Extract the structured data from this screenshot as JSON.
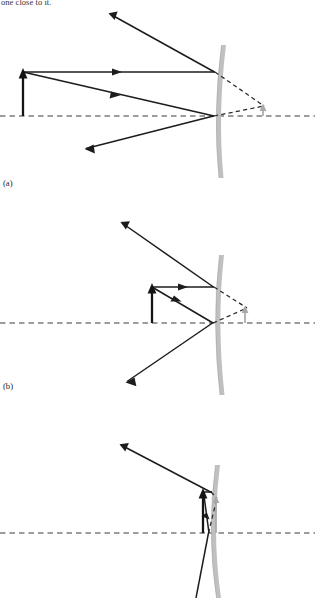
{
  "document": {
    "body_text_fragment": "one close to it.",
    "figure_type": "ray-diagram",
    "description": "Three ray-tracing diagrams for a convex mirror showing an object at decreasing distances from the mirror surface and the resulting virtual, upright, diminished images."
  },
  "panels": [
    {
      "id": "a",
      "label": "(a)",
      "label_x": 3,
      "label_y": 178,
      "object": {
        "name": "object-arrow",
        "base_x": 23,
        "base_y": 116,
        "tip_y": 72,
        "color": "#141414",
        "orientation": "upright"
      },
      "image": {
        "name": "image-arrow",
        "base_x": 263,
        "base_y": 116,
        "tip_y": 105,
        "color": "#a8a8a8",
        "orientation": "upright",
        "nature": "virtual"
      },
      "mirror": {
        "name": "convex-mirror",
        "vertex_x": 216,
        "vertex_y": 116,
        "top_x": 223,
        "top_y": 45,
        "bottom_x": 221,
        "bottom_y": 178,
        "thickness": 4.5,
        "color": "#bdbdbd"
      },
      "axis": {
        "y": 116,
        "x1": 0,
        "x2": 315
      },
      "rays": [
        {
          "name": "parallel-incident-ray",
          "points": "23,72 215,72",
          "head_at": "105,72",
          "head_angle": 0
        },
        {
          "name": "parallel-reflected-ray",
          "points": "215,72 109,14",
          "head_at": "111,15",
          "head_angle": 209
        },
        {
          "name": "vertex-incident-ray",
          "points": "23,72 214,116",
          "head_at": "110,96",
          "head_angle": 13
        },
        {
          "name": "vertex-reflected-ray",
          "points": "214,116 86,148",
          "head_at": "89,147",
          "head_angle": 194
        }
      ],
      "virtual_rays": [
        {
          "name": "virtual-ray-from-parallel",
          "points": "215,72 264,106"
        },
        {
          "name": "virtual-ray-from-vertex",
          "points": "214,116 264,106"
        }
      ]
    },
    {
      "id": "b",
      "label": "(b)",
      "label_x": 3,
      "label_y": 381,
      "object": {
        "name": "object-arrow",
        "base_x": 152,
        "base_y": 323,
        "tip_y": 287,
        "color": "#141414",
        "orientation": "upright"
      },
      "image": {
        "name": "image-arrow",
        "base_x": 245,
        "base_y": 323,
        "tip_y": 307,
        "color": "#a8a8a8",
        "orientation": "upright",
        "nature": "virtual"
      },
      "mirror": {
        "name": "convex-mirror",
        "vertex_x": 215,
        "vertex_y": 323,
        "top_x": 221,
        "top_y": 255,
        "bottom_x": 222,
        "bottom_y": 395,
        "thickness": 4.5,
        "color": "#bdbdbd"
      },
      "axis": {
        "y": 323,
        "x1": 0,
        "x2": 315
      },
      "rays": [
        {
          "name": "parallel-incident-ray",
          "points": "152,287 214,287",
          "head_at": "178,287",
          "head_angle": 0
        },
        {
          "name": "parallel-reflected-ray",
          "points": "214,287 122,223",
          "head_at": "124,225",
          "head_angle": 215
        },
        {
          "name": "vertex-incident-ray",
          "points": "152,287 213,323",
          "head_at": "172,300",
          "head_angle": 31
        },
        {
          "name": "vertex-reflected-ray",
          "points": "213,323 127,381",
          "head_at": "130,379",
          "head_angle": 214
        }
      ],
      "virtual_rays": [
        {
          "name": "virtual-ray-from-parallel",
          "points": "214,287 246,308"
        },
        {
          "name": "virtual-ray-from-vertex",
          "points": "213,323 246,308"
        }
      ]
    },
    {
      "id": "c",
      "label": "",
      "object": {
        "name": "object-arrow",
        "base_x": 205,
        "base_y": 533,
        "tip_y": 492,
        "color": "#141414",
        "orientation": "upright"
      },
      "image": {
        "name": "image-arrow",
        "base_x": 216,
        "base_y": 533,
        "tip_y": 496,
        "color": "#a8a8a8",
        "orientation": "upright",
        "nature": "virtual"
      },
      "mirror": {
        "name": "convex-mirror",
        "vertex_x": 211,
        "vertex_y": 533,
        "top_x": 217,
        "top_y": 465,
        "bottom_x": 218,
        "bottom_y": 598,
        "thickness": 4.5,
        "color": "#bdbdbd"
      },
      "axis": {
        "y": 533,
        "x1": 0,
        "x2": 315
      },
      "rays": [
        {
          "name": "parallel-incident-ray",
          "points": "205,492 212,492",
          "head_at": "209,492",
          "head_angle": 0
        },
        {
          "name": "parallel-reflected-ray",
          "points": "212,492 121,445",
          "head_at": "123,446",
          "head_angle": 207
        },
        {
          "name": "vertex-incident-ray",
          "points": "205,492 211,533",
          "head_at": "208,515",
          "head_angle": 82
        },
        {
          "name": "vertex-reflected-ray",
          "points": "211,533 196,598",
          "head_at": "197,592",
          "head_angle": 103
        }
      ],
      "virtual_rays": [
        {
          "name": "virtual-ray-from-parallel",
          "points": "212,492 217,497"
        },
        {
          "name": "virtual-ray-from-vertex",
          "points": "211,533 217,497"
        }
      ]
    }
  ],
  "colors": {
    "ray": "#1c1c1c",
    "virtual_ray": "#2a2a2a",
    "axis": "#3a3a3a",
    "object": "#141414",
    "image": "#a8a8a8",
    "mirror": "#bdbdbd",
    "background": "#ffffff"
  }
}
